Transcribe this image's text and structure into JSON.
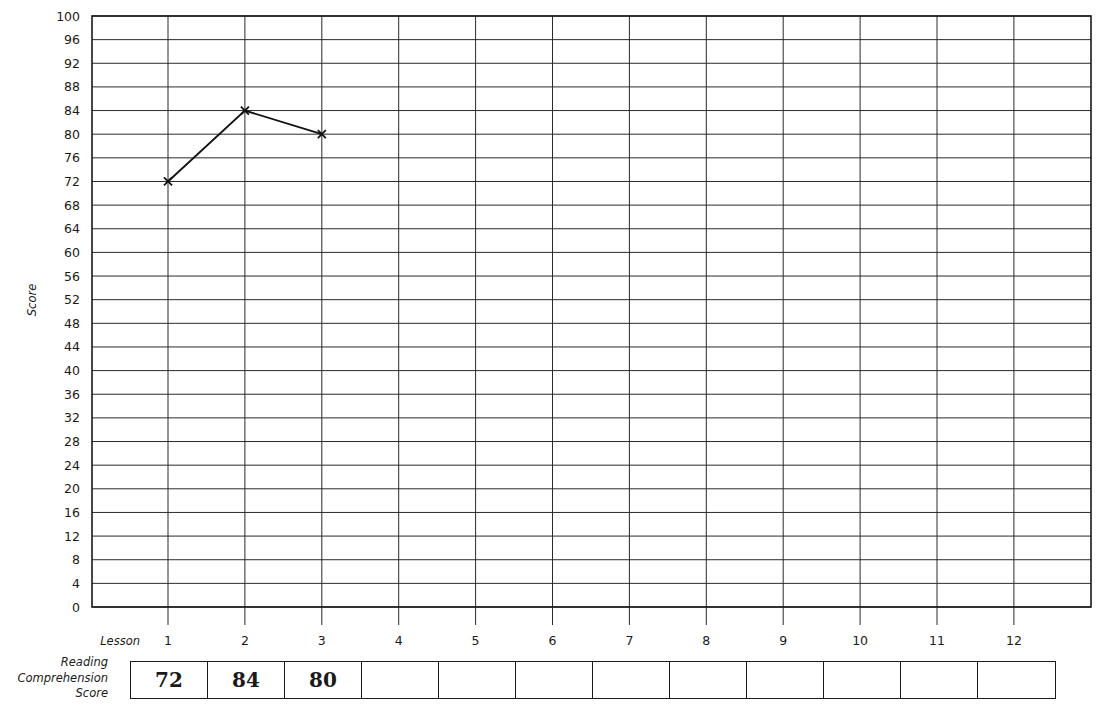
{
  "chart_data": {
    "type": "line",
    "title": "",
    "xlabel": "Lesson",
    "ylabel": "Score",
    "x": [
      1,
      2,
      3,
      4,
      5,
      6,
      7,
      8,
      9,
      10,
      11,
      12
    ],
    "series": [
      {
        "name": "Reading Comprehension Score",
        "values": [
          72,
          84,
          80,
          null,
          null,
          null,
          null,
          null,
          null,
          null,
          null,
          null
        ],
        "marker": "x"
      }
    ],
    "ylim": [
      0,
      100
    ],
    "yticks": [
      0,
      4,
      8,
      12,
      16,
      20,
      24,
      28,
      32,
      36,
      40,
      44,
      48,
      52,
      56,
      60,
      64,
      68,
      72,
      76,
      80,
      84,
      88,
      92,
      96,
      100
    ],
    "xticks": [
      "1",
      "2",
      "3",
      "4",
      "5",
      "6",
      "7",
      "8",
      "9",
      "10",
      "11",
      "12"
    ],
    "grid": true,
    "legend": "none"
  },
  "labels": {
    "y_axis": "Score",
    "x_axis": "Lesson",
    "table_label_lines": [
      "Reading",
      "Comprehension",
      "Score"
    ]
  },
  "score_table": {
    "cells": [
      "72",
      "84",
      "80",
      "",
      "",
      "",
      "",
      "",
      "",
      "",
      "",
      ""
    ]
  }
}
